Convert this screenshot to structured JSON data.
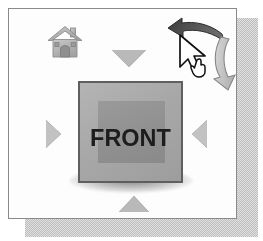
{
  "widget": {
    "title": "3D View Navigation Widget",
    "panel_background": "#fdfdfd",
    "panel_border_color": "#8a8a8a",
    "shadow_color": "#bdbdbd"
  },
  "cube": {
    "face_label": "FRONT",
    "face_color": "#a8a8a8",
    "inner_face_color": "#909090",
    "border_color": "#5f5f5f",
    "label_color": "#1d1d1d"
  },
  "nav_arrows": [
    {
      "name": "nav-arrow-top",
      "direction": "down",
      "tooltip": "Rotate view down",
      "color": "#b9b9b9"
    },
    {
      "name": "nav-arrow-bottom",
      "direction": "up",
      "tooltip": "Rotate view up",
      "color": "#b9b9b9"
    },
    {
      "name": "nav-arrow-left",
      "direction": "right",
      "tooltip": "Rotate view right",
      "color": "#c2c2c2"
    },
    {
      "name": "nav-arrow-right",
      "direction": "left",
      "tooltip": "Rotate view left",
      "color": "#c2c2c2"
    }
  ],
  "home_button": {
    "icon": "home-icon",
    "tooltip": "Home view",
    "color": "#b0b0b0"
  },
  "rotate_controls": {
    "counterclockwise": {
      "icon": "curved-arrow-left-icon",
      "tooltip": "Rotate counterclockwise",
      "color": "#4a4a4a",
      "state": "hovered"
    },
    "clockwise": {
      "icon": "curved-arrow-down-icon",
      "tooltip": "Rotate clockwise",
      "color": "#c4c4c4",
      "state": "normal"
    }
  },
  "pointer": {
    "icon": "cursor-hand-icon",
    "fill": "#ffffff",
    "outline": "#111111"
  }
}
